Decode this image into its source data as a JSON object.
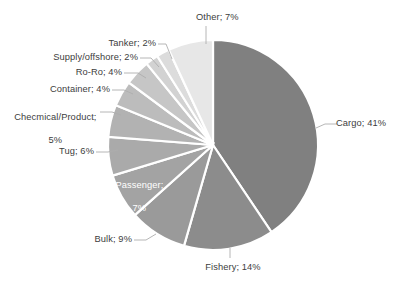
{
  "chart_data": {
    "type": "pie",
    "title": "",
    "subtitle": "",
    "xlabel": "",
    "ylabel": "",
    "legend_position": "none",
    "grid": false,
    "units": "percent",
    "categories": [
      "Cargo",
      "Fishery",
      "Bulk",
      "Passenger",
      "Tug",
      "Checmical/Product",
      "Container",
      "Ro-Ro",
      "Supply/offshore",
      "Tanker",
      "Other"
    ],
    "values": [
      41,
      14,
      9,
      7,
      6,
      5,
      4,
      4,
      2,
      2,
      7
    ],
    "labels": [
      "Cargo; 41%",
      "Fishery; 14%",
      "Bulk; 9%",
      "Passenger;\n7%",
      "Tug; 6%",
      "Checmical/Product;\n5%",
      "Container; 4%",
      "Ro-Ro; 4%",
      "Supply/offshore; 2%",
      "Tanker; 2%",
      "Other; 7%"
    ],
    "colors": [
      "#808080",
      "#8c8c8c",
      "#9a9a9a",
      "#a3a3a3",
      "#aaaaaa",
      "#b2b2b2",
      "#bcbcbc",
      "#c6c6c6",
      "#d2d2d2",
      "#dcdcdc",
      "#e7e7e7"
    ],
    "slice_order_clockwise_from_top": [
      "Cargo",
      "Fishery",
      "Bulk",
      "Passenger",
      "Tug",
      "Checmical/Product",
      "Container",
      "Ro-Ro",
      "Supply/offshore",
      "Tanker",
      "Other"
    ],
    "start_angle_deg": 0,
    "direction": "clockwise",
    "total": 101
  },
  "labels": {
    "cargo": "Cargo; 41%",
    "fishery": "Fishery; 14%",
    "bulk": "Bulk; 9%",
    "passenger_line1": "Passenger;",
    "passenger_line2": "7%",
    "tug": "Tug; 6%",
    "chemical_line1": "Checmical/Product;",
    "chemical_line2": "5%",
    "container": "Container; 4%",
    "roro": "Ro-Ro; 4%",
    "supply": "Supply/offshore; 2%",
    "tanker": "Tanker; 2%",
    "other": "Other; 7%"
  }
}
